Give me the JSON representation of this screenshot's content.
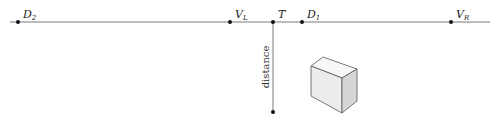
{
  "diagram": {
    "horizon_line": {
      "x1": 10,
      "x2": 490,
      "y": 22,
      "color": "#555555"
    },
    "points": [
      {
        "id": "D2",
        "base": "D",
        "sub": "2",
        "x": 18,
        "y": 22
      },
      {
        "id": "VL",
        "base": "V",
        "sub": "L",
        "x": 230,
        "y": 22
      },
      {
        "id": "T",
        "base": "T",
        "sub": "",
        "x": 273,
        "y": 22
      },
      {
        "id": "D1",
        "base": "D",
        "sub": "1",
        "x": 302,
        "y": 22
      },
      {
        "id": "VR",
        "base": "V",
        "sub": "R",
        "x": 451,
        "y": 22
      }
    ],
    "distance_line": {
      "x": 273,
      "y1": 22,
      "y2": 112,
      "label": "distance",
      "end_point_y": 112
    },
    "box": {
      "front_face": "311,66 342,78 342,113 311,96",
      "top_face": "311,66 323,57 357,69 342,78",
      "right_face": "342,78 357,69 357,101 342,113",
      "front_fill": "#ececec",
      "top_fill": "#f7f7f7",
      "right_fill": "#d6d6d6",
      "stroke": "#555555"
    }
  }
}
